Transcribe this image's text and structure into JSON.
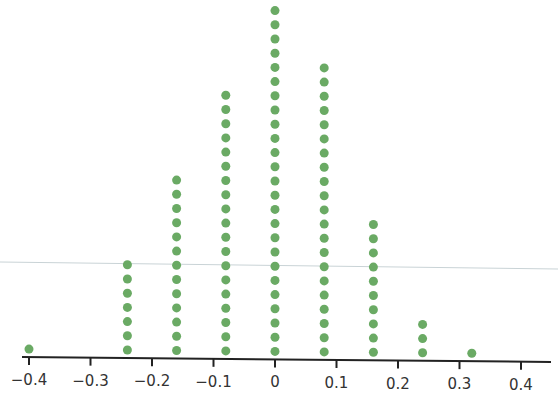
{
  "chart_data": {
    "type": "scatter",
    "subtype": "dot-plot",
    "title": "",
    "xlabel": "",
    "ylabel": "",
    "xlim": [
      -0.4,
      0.4
    ],
    "x_ticks": [
      -0.4,
      -0.3,
      -0.2,
      -0.1,
      0,
      0.1,
      0.2,
      0.3,
      0.4
    ],
    "x_tick_labels": [
      "−0.4",
      "−0.3",
      "−0.2",
      "−0.1",
      "0",
      "0.1",
      "0.2",
      "0.3",
      "0.4"
    ],
    "grid": false,
    "legend": null,
    "x": [
      -0.4,
      -0.24,
      -0.16,
      -0.08,
      0,
      0.08,
      0.16,
      0.24,
      0.32
    ],
    "counts": [
      1,
      7,
      13,
      19,
      25,
      21,
      10,
      3,
      1
    ],
    "dot_color": "#6aaa64",
    "axis_color": "#222222"
  }
}
